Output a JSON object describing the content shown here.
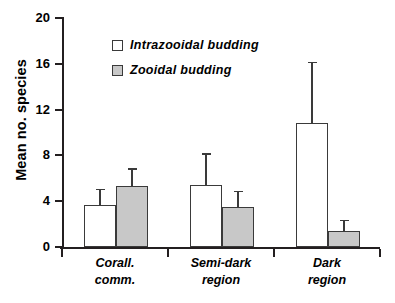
{
  "chart_data": {
    "type": "bar",
    "title": "",
    "xlabel": "",
    "ylabel": "Mean no. species",
    "ylim": [
      0,
      20
    ],
    "yticks": [
      0,
      4,
      8,
      12,
      16,
      20
    ],
    "ytick_labels": [
      "0",
      "4",
      "8",
      "12",
      "16",
      "20"
    ],
    "grid": false,
    "legend_position": "upper-left-inside",
    "categories": [
      "Corall.\ncomm.",
      "Semi-dark\nregion",
      "Dark\nregion"
    ],
    "category_labels_flat": [
      "Corall. comm.",
      "Semi-dark region",
      "Dark region"
    ],
    "series": [
      {
        "name": "Intrazooidal budding",
        "color": "#ffffff",
        "values": [
          3.65,
          5.4,
          10.8
        ],
        "error_upper": [
          5.1,
          8.2,
          16.2
        ]
      },
      {
        "name": "Zooidal budding",
        "color": "#c8c8c8",
        "values": [
          5.3,
          3.5,
          1.4
        ],
        "error_upper": [
          6.9,
          4.9,
          2.4
        ]
      }
    ]
  },
  "legend": {
    "items": [
      {
        "label": "Intrazooidal budding",
        "swatch": "white"
      },
      {
        "label": "Zooidal budding",
        "swatch": "gray"
      }
    ]
  },
  "axis": {
    "y_title": "Mean no. species"
  },
  "colors": {
    "bar_white": "#ffffff",
    "bar_gray": "#c8c8c8",
    "outline": "#3a3a3a",
    "axis": "#231f20",
    "background": "#ffffff"
  }
}
